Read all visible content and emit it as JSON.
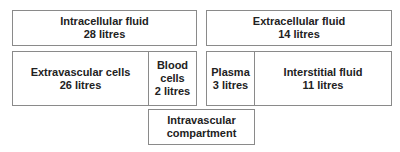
{
  "diagram": {
    "intracellular": {
      "label": "Intracellular fluid",
      "volume": "28 litres"
    },
    "extracellular": {
      "label": "Extracellular fluid",
      "volume": "14 litres"
    },
    "extravascular_cells": {
      "label": "Extravascular cells",
      "volume": "26 litres"
    },
    "blood_cells": {
      "label_line1": "Blood",
      "label_line2": "cells",
      "volume": "2 litres"
    },
    "plasma": {
      "label": "Plasma",
      "volume": "3 litres"
    },
    "interstitial": {
      "label": "Interstitial fluid",
      "volume": "11 litres"
    },
    "intravascular": {
      "label_line1": "Intravascular",
      "label_line2": "compartment"
    },
    "border_color": "#8a8a8a",
    "text_color": "#222222"
  }
}
